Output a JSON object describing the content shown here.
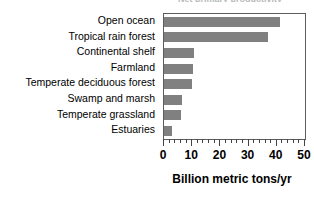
{
  "figure": {
    "title_remnant": "Net primary productivity",
    "bar_color": "#808080",
    "frame_color": "#5d5d5d",
    "text_color": "#000000"
  },
  "chart_data": {
    "type": "bar",
    "orientation": "horizontal",
    "title": "",
    "xlabel": "Billion metric tons/yr",
    "ylabel": "",
    "categories": [
      "Open ocean",
      "Tropical rain forest",
      "Continental shelf",
      "Farmland",
      "Temperate deciduous forest",
      "Swamp and marsh",
      "Temperate grassland",
      "Estuaries"
    ],
    "values": [
      41,
      37,
      10.5,
      10.3,
      10,
      6.5,
      6,
      3
    ],
    "xlim": [
      0,
      50
    ],
    "xticks": [
      0,
      10,
      20,
      30,
      40,
      50
    ],
    "xtick_labels": [
      "0",
      "10",
      "20",
      "30",
      "40",
      "50"
    ],
    "minor_tick_step": 2,
    "grid": false,
    "legend": false
  }
}
